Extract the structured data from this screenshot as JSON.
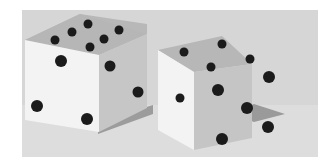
{
  "image": {
    "subject": "two dice",
    "alt": "Grayscale illustration of two white dice with black pips casting shadows on a gray surface",
    "colors": {
      "page_background": "#ffffff",
      "backdrop": "#d4d4d4",
      "floor": "#dcdcdc",
      "die_face_light": "#f2f2f2",
      "die_face_top": "#b9b9b9",
      "die_face_side": "#c4c4c4",
      "shadow": "#9a9a9a",
      "pip": "#1a1a1a"
    }
  },
  "dice": [
    {
      "name": "left-die",
      "top_pips": 6,
      "front_pips": 3,
      "side_pips": 3
    },
    {
      "name": "right-die",
      "top_pips": 4,
      "front_pips": 1,
      "side_pips": 5
    }
  ]
}
